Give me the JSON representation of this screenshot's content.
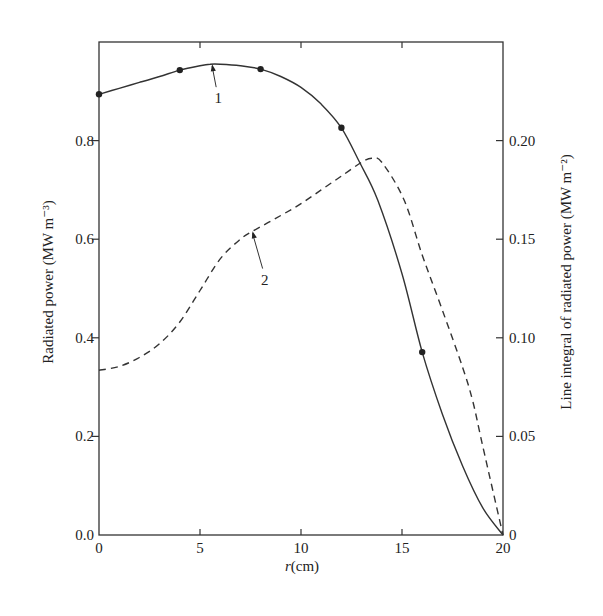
{
  "chart_data": {
    "type": "line",
    "title": "",
    "xlabel": "r(cm)",
    "ylabel": "Radiated power (MW m⁻³)",
    "ylabel_right": "Line integral of radiated power (MW m⁻²)",
    "xlim": [
      0,
      20
    ],
    "ylim": [
      0,
      1.0
    ],
    "ylim_right": [
      0,
      0.25
    ],
    "x_ticks": [
      0,
      5,
      10,
      15,
      20
    ],
    "x_tick_labels": [
      "0",
      "5",
      "10",
      "15",
      "20"
    ],
    "y_ticks": [
      0.0,
      0.2,
      0.4,
      0.6,
      0.8
    ],
    "y_tick_labels": [
      "0.0",
      "0.2",
      "0.4",
      "0.6",
      "0.8"
    ],
    "y_right_ticks": [
      0,
      0.05,
      0.1,
      0.15,
      0.2
    ],
    "y_right_tick_labels": [
      "0",
      "0.05",
      "0.10",
      "0.15",
      "0.20"
    ],
    "grid": false,
    "legend": null,
    "series": [
      {
        "name": "1",
        "axis": "left",
        "style": "solid",
        "markers": {
          "x": [
            0,
            4,
            8,
            12,
            16
          ],
          "y": [
            0.894,
            0.943,
            0.945,
            0.826,
            0.371
          ]
        },
        "x": [
          0,
          1,
          2,
          3,
          4,
          5,
          5.5,
          6,
          7,
          8,
          9,
          10,
          11,
          12,
          12.9,
          13.8,
          15,
          16,
          17,
          18,
          19,
          20
        ],
        "y": [
          0.894,
          0.906,
          0.918,
          0.93,
          0.943,
          0.952,
          0.955,
          0.955,
          0.952,
          0.945,
          0.93,
          0.908,
          0.874,
          0.826,
          0.756,
          0.679,
          0.53,
          0.371,
          0.245,
          0.14,
          0.055,
          0.0
        ]
      },
      {
        "name": "2",
        "axis": "right",
        "style": "dashed",
        "x": [
          0,
          1,
          2,
          3,
          4,
          5,
          6,
          7,
          7.6,
          9,
          10,
          11,
          12,
          13,
          13.5,
          14,
          15.1,
          16,
          17,
          18,
          18.5,
          19,
          20
        ],
        "y": [
          0.0835,
          0.0855,
          0.09,
          0.097,
          0.108,
          0.124,
          0.14,
          0.15,
          0.154,
          0.162,
          0.168,
          0.175,
          0.182,
          0.189,
          0.191,
          0.189,
          0.17,
          0.142,
          0.114,
          0.085,
          0.068,
          0.045,
          0.0
        ]
      }
    ],
    "annotations": [
      {
        "text": "1",
        "series": "1",
        "arrow_to": [
          5.6,
          0.955
        ],
        "text_at": [
          5.9,
          0.88
        ]
      },
      {
        "text": "2",
        "series": "2",
        "arrow_to": [
          7.6,
          0.154
        ],
        "text_at": [
          8.2,
          0.128
        ]
      }
    ]
  }
}
